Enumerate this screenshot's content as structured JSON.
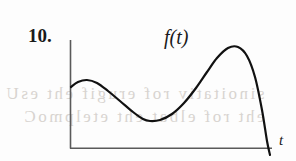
{
  "figure": {
    "problem_number": "10.",
    "function_label": "f(t)",
    "x_axis_label": "t",
    "background_color": "#fdfdfd",
    "curve_color": "#111111",
    "axis_color": "#5a5a5a",
    "ghost_text": {
      "line1": "sinoitativ rof erugif eht esU",
      "line2": "eht rof elbat eht etelpmoC"
    }
  },
  "chart_data": {
    "type": "line",
    "title": "f(t)",
    "xlabel": "t",
    "ylabel": "",
    "grid": false,
    "legend": null,
    "axis_origin_px": [
      70,
      148
    ],
    "x_axis_extent_px": [
      70,
      272
    ],
    "y_axis_extent_px": [
      40,
      148
    ],
    "series": [
      {
        "name": "f(t)",
        "points_px": [
          [
            71,
            87
          ],
          [
            78,
            82
          ],
          [
            87,
            80
          ],
          [
            97,
            83
          ],
          [
            108,
            91
          ],
          [
            120,
            101
          ],
          [
            133,
            112
          ],
          [
            143,
            119
          ],
          [
            150,
            121
          ],
          [
            160,
            120
          ],
          [
            172,
            114
          ],
          [
            184,
            103
          ],
          [
            196,
            88
          ],
          [
            207,
            72
          ],
          [
            217,
            58
          ],
          [
            228,
            48
          ],
          [
            238,
            47
          ],
          [
            247,
            56
          ],
          [
            255,
            77
          ],
          [
            262,
            110
          ],
          [
            267,
            141
          ],
          [
            270,
            155
          ]
        ],
        "features": {
          "start_on_y_axis": [
            71,
            87
          ],
          "local_maximum": [
            87,
            80
          ],
          "local_minimum": [
            150,
            121
          ],
          "global_maximum": [
            228,
            48
          ],
          "x_axis_crossing": [
            268,
            148
          ],
          "end": [
            270,
            155
          ]
        }
      }
    ]
  }
}
